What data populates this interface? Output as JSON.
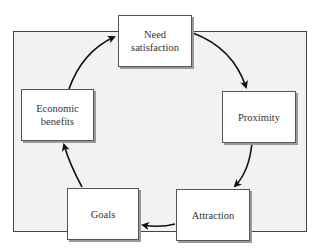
{
  "diagram": {
    "type": "cycle",
    "nodes": [
      {
        "id": "need",
        "label": "Need\nsatisfaction"
      },
      {
        "id": "proximity",
        "label": "Proximity"
      },
      {
        "id": "attraction",
        "label": "Attraction"
      },
      {
        "id": "goals",
        "label": "Goals"
      },
      {
        "id": "economic",
        "label": "Economic\nbenefits"
      }
    ],
    "edges": [
      {
        "from": "need",
        "to": "proximity"
      },
      {
        "from": "proximity",
        "to": "attraction"
      },
      {
        "from": "attraction",
        "to": "goals"
      },
      {
        "from": "goals",
        "to": "economic"
      },
      {
        "from": "economic",
        "to": "need"
      }
    ]
  },
  "colors": {
    "frame_bg": "#f2f2f2",
    "box_bg": "#ffffff",
    "line": "#111111"
  }
}
